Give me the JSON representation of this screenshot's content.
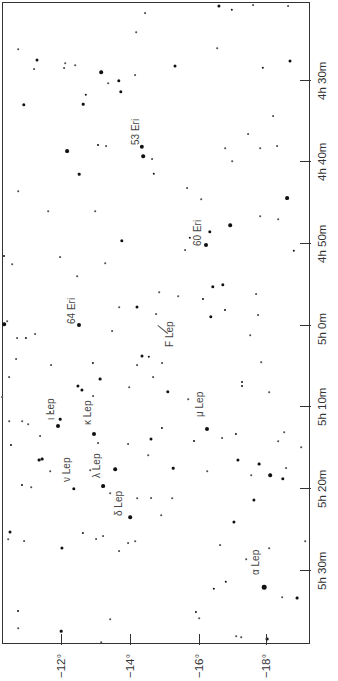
{
  "map": {
    "type": "star-chart",
    "orientation": "rotated 90° counter-clockwise (RA runs top→bottom, Dec runs left→right)",
    "frame": {
      "left": 2,
      "top": 2,
      "right": 311,
      "bottom": 645
    },
    "ra_axis": {
      "side": "right",
      "ticks": [
        {
          "label": "4h 30m",
          "y": 80
        },
        {
          "label": "4h 40m",
          "y": 161
        },
        {
          "label": "4h 50m",
          "y": 243
        },
        {
          "label": "5h 0m",
          "y": 325
        },
        {
          "label": "5h 10m",
          "y": 406
        },
        {
          "label": "5h 20m",
          "y": 488
        },
        {
          "label": "5h 30m",
          "y": 570
        }
      ]
    },
    "dec_axis": {
      "side": "bottom",
      "ticks": [
        {
          "label": "−12°",
          "x": 61
        },
        {
          "label": "−14°",
          "x": 130
        },
        {
          "label": "−16°",
          "x": 199
        },
        {
          "label": "−18°",
          "x": 266
        }
      ]
    },
    "labels": [
      {
        "text": "53 Eri",
        "x": 136,
        "y": 145
      },
      {
        "text": "60 Eri",
        "x": 198,
        "y": 246
      },
      {
        "text": "64 Eri",
        "x": 72,
        "y": 324
      },
      {
        "text": "F Lep",
        "x": 170,
        "y": 347
      },
      {
        "text": "ι Lep",
        "x": 51,
        "y": 420
      },
      {
        "text": "κ Lep",
        "x": 88,
        "y": 425
      },
      {
        "text": "μ Lep",
        "x": 200,
        "y": 417
      },
      {
        "text": "ν Lep",
        "x": 67,
        "y": 482
      },
      {
        "text": "λ Lep",
        "x": 97,
        "y": 478
      },
      {
        "text": "δ Lep",
        "x": 119,
        "y": 516
      },
      {
        "text": "α Lep",
        "x": 256,
        "y": 575
      }
    ],
    "pointer": {
      "from_x": 158,
      "from_y": 325,
      "to_x": 168,
      "to_y": 333
    },
    "stars": [
      {
        "x": 219,
        "y": 6,
        "r": 1.6
      },
      {
        "x": 232,
        "y": 10,
        "r": 1.2
      },
      {
        "x": 253,
        "y": 5,
        "r": 0.9
      },
      {
        "x": 288,
        "y": 6,
        "r": 0.9
      },
      {
        "x": 145,
        "y": 13,
        "r": 0.9
      },
      {
        "x": 136,
        "y": 32,
        "r": 0.8
      },
      {
        "x": 18,
        "y": 49,
        "r": 0.8
      },
      {
        "x": 217,
        "y": 48,
        "r": 0.8
      },
      {
        "x": 37,
        "y": 60,
        "r": 1.5
      },
      {
        "x": 65,
        "y": 63,
        "r": 0.8
      },
      {
        "x": 75,
        "y": 65,
        "r": 0.8
      },
      {
        "x": 34,
        "y": 69,
        "r": 0.9
      },
      {
        "x": 64,
        "y": 68,
        "r": 0.9
      },
      {
        "x": 101,
        "y": 72,
        "r": 1.8
      },
      {
        "x": 175,
        "y": 66,
        "r": 1.5
      },
      {
        "x": 263,
        "y": 68,
        "r": 1.2
      },
      {
        "x": 290,
        "y": 61,
        "r": 1.5
      },
      {
        "x": 119,
        "y": 81,
        "r": 1.7
      },
      {
        "x": 135,
        "y": 75,
        "r": 0.9
      },
      {
        "x": 108,
        "y": 83,
        "r": 0.8
      },
      {
        "x": 121,
        "y": 92,
        "r": 1.7
      },
      {
        "x": 86,
        "y": 95,
        "r": 1.2
      },
      {
        "x": 24,
        "y": 105,
        "r": 1.7
      },
      {
        "x": 83,
        "y": 104,
        "r": 1.3
      },
      {
        "x": 273,
        "y": 116,
        "r": 0.9
      },
      {
        "x": 248,
        "y": 134,
        "r": 0.9
      },
      {
        "x": 142,
        "y": 147,
        "r": 2.2
      },
      {
        "x": 98,
        "y": 145,
        "r": 1.0
      },
      {
        "x": 106,
        "y": 146,
        "r": 0.9
      },
      {
        "x": 225,
        "y": 148,
        "r": 0.8
      },
      {
        "x": 260,
        "y": 148,
        "r": 0.8
      },
      {
        "x": 277,
        "y": 146,
        "r": 0.9
      },
      {
        "x": 67,
        "y": 151,
        "r": 1.9
      },
      {
        "x": 143,
        "y": 156,
        "r": 1.8
      },
      {
        "x": 152,
        "y": 159,
        "r": 0.9
      },
      {
        "x": 232,
        "y": 161,
        "r": 0.8
      },
      {
        "x": 79,
        "y": 174,
        "r": 1.3
      },
      {
        "x": 154,
        "y": 174,
        "r": 1.2
      },
      {
        "x": 18,
        "y": 191,
        "r": 0.8
      },
      {
        "x": 187,
        "y": 188,
        "r": 0.9
      },
      {
        "x": 287,
        "y": 198,
        "r": 1.9
      },
      {
        "x": 201,
        "y": 199,
        "r": 0.8
      },
      {
        "x": 48,
        "y": 211,
        "r": 0.8
      },
      {
        "x": 95,
        "y": 211,
        "r": 0.8
      },
      {
        "x": 260,
        "y": 216,
        "r": 0.8
      },
      {
        "x": 278,
        "y": 219,
        "r": 0.8
      },
      {
        "x": 230,
        "y": 225,
        "r": 1.8
      },
      {
        "x": 210,
        "y": 232,
        "r": 1.7
      },
      {
        "x": 190,
        "y": 238,
        "r": 1.2
      },
      {
        "x": 185,
        "y": 250,
        "r": 0.9
      },
      {
        "x": 206,
        "y": 245,
        "r": 2.0
      },
      {
        "x": 294,
        "y": 251,
        "r": 1.2
      },
      {
        "x": 122,
        "y": 241,
        "r": 1.7
      },
      {
        "x": 4,
        "y": 256,
        "r": 1.0
      },
      {
        "x": 12,
        "y": 264,
        "r": 0.8
      },
      {
        "x": 60,
        "y": 257,
        "r": 0.9
      },
      {
        "x": 105,
        "y": 263,
        "r": 0.8
      },
      {
        "x": 77,
        "y": 276,
        "r": 0.8
      },
      {
        "x": 213,
        "y": 287,
        "r": 1.7
      },
      {
        "x": 223,
        "y": 285,
        "r": 1.7
      },
      {
        "x": 256,
        "y": 294,
        "r": 0.9
      },
      {
        "x": 159,
        "y": 292,
        "r": 0.8
      },
      {
        "x": 178,
        "y": 296,
        "r": 0.8
      },
      {
        "x": 203,
        "y": 299,
        "r": 1.0
      },
      {
        "x": 119,
        "y": 307,
        "r": 0.8
      },
      {
        "x": 137,
        "y": 307,
        "r": 1.5
      },
      {
        "x": 225,
        "y": 310,
        "r": 1.0
      },
      {
        "x": 156,
        "y": 314,
        "r": 0.9
      },
      {
        "x": 211,
        "y": 317,
        "r": 1.7
      },
      {
        "x": 258,
        "y": 315,
        "r": 0.9
      },
      {
        "x": 79,
        "y": 325,
        "r": 2.0
      },
      {
        "x": 4,
        "y": 324,
        "r": 1.8
      },
      {
        "x": 7,
        "y": 321,
        "r": 0.8
      },
      {
        "x": 35,
        "y": 334,
        "r": 0.9
      },
      {
        "x": 112,
        "y": 331,
        "r": 0.9
      },
      {
        "x": 250,
        "y": 335,
        "r": 0.8
      },
      {
        "x": 17,
        "y": 338,
        "r": 0.9
      },
      {
        "x": 26,
        "y": 338,
        "r": 1.1
      },
      {
        "x": 142,
        "y": 356,
        "r": 1.5
      },
      {
        "x": 149,
        "y": 357,
        "r": 1.2
      },
      {
        "x": 16,
        "y": 359,
        "r": 0.9
      },
      {
        "x": 93,
        "y": 363,
        "r": 1.1
      },
      {
        "x": 162,
        "y": 363,
        "r": 0.9
      },
      {
        "x": 137,
        "y": 365,
        "r": 0.9
      },
      {
        "x": 51,
        "y": 365,
        "r": 0.9
      },
      {
        "x": 261,
        "y": 362,
        "r": 0.8
      },
      {
        "x": 153,
        "y": 377,
        "r": 0.9
      },
      {
        "x": 9,
        "y": 377,
        "r": 0.9
      },
      {
        "x": 100,
        "y": 379,
        "r": 1.4
      },
      {
        "x": 78,
        "y": 386,
        "r": 1.6
      },
      {
        "x": 82,
        "y": 390,
        "r": 1.6
      },
      {
        "x": 168,
        "y": 392,
        "r": 1.7
      },
      {
        "x": 129,
        "y": 387,
        "r": 0.8
      },
      {
        "x": 242,
        "y": 382,
        "r": 1.0
      },
      {
        "x": 242,
        "y": 386,
        "r": 1.0
      },
      {
        "x": 269,
        "y": 392,
        "r": 0.8
      },
      {
        "x": 93,
        "y": 396,
        "r": 0.9
      },
      {
        "x": 2,
        "y": 397,
        "r": 0.9
      },
      {
        "x": 188,
        "y": 399,
        "r": 0.8
      },
      {
        "x": 50,
        "y": 412,
        "r": 0.9
      },
      {
        "x": 9,
        "y": 421,
        "r": 0.8
      },
      {
        "x": 22,
        "y": 421,
        "r": 0.8
      },
      {
        "x": 28,
        "y": 424,
        "r": 0.8
      },
      {
        "x": 58,
        "y": 426,
        "r": 2.0
      },
      {
        "x": 60,
        "y": 419,
        "r": 1.3
      },
      {
        "x": 162,
        "y": 428,
        "r": 1.1
      },
      {
        "x": 94,
        "y": 434,
        "r": 2.0
      },
      {
        "x": 207,
        "y": 429,
        "r": 2.0
      },
      {
        "x": 40,
        "y": 436,
        "r": 0.9
      },
      {
        "x": 222,
        "y": 438,
        "r": 0.9
      },
      {
        "x": 236,
        "y": 434,
        "r": 1.1
      },
      {
        "x": 284,
        "y": 432,
        "r": 0.8
      },
      {
        "x": 278,
        "y": 441,
        "r": 0.8
      },
      {
        "x": 151,
        "y": 439,
        "r": 1.5
      },
      {
        "x": 98,
        "y": 443,
        "r": 0.9
      },
      {
        "x": 128,
        "y": 444,
        "r": 0.9
      },
      {
        "x": 194,
        "y": 441,
        "r": 1.0
      },
      {
        "x": 11,
        "y": 445,
        "r": 1.0
      },
      {
        "x": 301,
        "y": 447,
        "r": 0.8
      },
      {
        "x": 148,
        "y": 455,
        "r": 0.8
      },
      {
        "x": 39,
        "y": 460,
        "r": 1.4
      },
      {
        "x": 42,
        "y": 459,
        "r": 1.4
      },
      {
        "x": 238,
        "y": 460,
        "r": 1.6
      },
      {
        "x": 259,
        "y": 464,
        "r": 1.4
      },
      {
        "x": 115,
        "y": 469,
        "r": 1.8
      },
      {
        "x": 173,
        "y": 468,
        "r": 1.3
      },
      {
        "x": 90,
        "y": 470,
        "r": 0.8
      },
      {
        "x": 251,
        "y": 475,
        "r": 0.8
      },
      {
        "x": 286,
        "y": 468,
        "r": 0.9
      },
      {
        "x": 270,
        "y": 475,
        "r": 1.8
      },
      {
        "x": 283,
        "y": 479,
        "r": 1.7
      },
      {
        "x": 50,
        "y": 471,
        "r": 0.8
      },
      {
        "x": 207,
        "y": 471,
        "r": 0.8
      },
      {
        "x": 22,
        "y": 485,
        "r": 1.0
      },
      {
        "x": 31,
        "y": 487,
        "r": 0.8
      },
      {
        "x": 74,
        "y": 489,
        "r": 1.7
      },
      {
        "x": 103,
        "y": 486,
        "r": 1.9
      },
      {
        "x": 110,
        "y": 493,
        "r": 0.8
      },
      {
        "x": 137,
        "y": 498,
        "r": 0.8
      },
      {
        "x": 151,
        "y": 498,
        "r": 0.9
      },
      {
        "x": 172,
        "y": 498,
        "r": 0.8
      },
      {
        "x": 254,
        "y": 500,
        "r": 1.6
      },
      {
        "x": 130,
        "y": 517,
        "r": 1.8
      },
      {
        "x": 161,
        "y": 515,
        "r": 0.8
      },
      {
        "x": 234,
        "y": 522,
        "r": 1.6
      },
      {
        "x": 10,
        "y": 532,
        "r": 1.5
      },
      {
        "x": 8,
        "y": 539,
        "r": 0.8
      },
      {
        "x": 24,
        "y": 541,
        "r": 0.9
      },
      {
        "x": 83,
        "y": 533,
        "r": 1.1
      },
      {
        "x": 96,
        "y": 539,
        "r": 0.9
      },
      {
        "x": 103,
        "y": 536,
        "r": 0.9
      },
      {
        "x": 128,
        "y": 543,
        "r": 0.9
      },
      {
        "x": 135,
        "y": 541,
        "r": 0.8
      },
      {
        "x": 62,
        "y": 548,
        "r": 1.6
      },
      {
        "x": 119,
        "y": 551,
        "r": 0.9
      },
      {
        "x": 220,
        "y": 545,
        "r": 0.9
      },
      {
        "x": 269,
        "y": 548,
        "r": 0.8
      },
      {
        "x": 305,
        "y": 541,
        "r": 0.8
      },
      {
        "x": 246,
        "y": 559,
        "r": 0.8
      },
      {
        "x": 226,
        "y": 582,
        "r": 1.2
      },
      {
        "x": 264,
        "y": 587,
        "r": 2.3
      },
      {
        "x": 214,
        "y": 589,
        "r": 1.2
      },
      {
        "x": 282,
        "y": 597,
        "r": 0.8
      },
      {
        "x": 297,
        "y": 598,
        "r": 1.4
      },
      {
        "x": 18,
        "y": 611,
        "r": 1.0
      },
      {
        "x": 196,
        "y": 612,
        "r": 1.1
      },
      {
        "x": 199,
        "y": 618,
        "r": 0.8
      },
      {
        "x": 110,
        "y": 619,
        "r": 0.8
      },
      {
        "x": 18,
        "y": 628,
        "r": 0.8
      },
      {
        "x": 61,
        "y": 631,
        "r": 1.3
      },
      {
        "x": 236,
        "y": 636,
        "r": 0.8
      },
      {
        "x": 241,
        "y": 637,
        "r": 0.8
      },
      {
        "x": 101,
        "y": 642,
        "r": 0.8
      },
      {
        "x": 267,
        "y": 639,
        "r": 1.4
      }
    ]
  },
  "colors": {
    "frame": "#333333",
    "star": "#111111",
    "label": "#444444",
    "background": "#ffffff"
  }
}
